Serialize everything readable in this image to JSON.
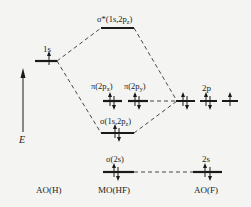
{
  "axis": {
    "label": "E"
  },
  "columns": {
    "left": "AO(H)",
    "middle": "MO(HF)",
    "right": "AO(F)"
  },
  "levels": {
    "h_1s": {
      "label": "1s",
      "electrons": 1
    },
    "sigma_star": {
      "label": "σ*(1s,2pz)",
      "electrons": 0
    },
    "pi_x": {
      "label": "π(2px)",
      "electrons": 2
    },
    "pi_y": {
      "label": "π(2py)",
      "electrons": 2
    },
    "sigma_1s2pz": {
      "label": "σ(1s,2pz)",
      "electrons": 2
    },
    "sigma_2s": {
      "label": "σ(2s)",
      "electrons": 2
    },
    "f_2p": {
      "label": "2p",
      "electrons": [
        2,
        2,
        1
      ]
    },
    "f_2s": {
      "label": "2s",
      "electrons": 2
    }
  },
  "colors": {
    "line": "#1a1a1a",
    "background": "#f4f4f2"
  }
}
